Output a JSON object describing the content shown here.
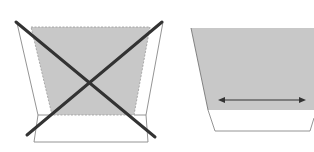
{
  "diagram": {
    "panels": [
      {
        "id": "left",
        "meaning": "incorrect",
        "description": "Tapered gray shape with flared side flaps, crossed out"
      },
      {
        "id": "right",
        "meaning": "correct",
        "description": "Gray shape over white base with horizontal double-headed arrow"
      }
    ],
    "colors": {
      "fill_gray": "#c8c8c8",
      "line_dark": "#333333",
      "line_light": "#888888",
      "background": "#ffffff"
    }
  }
}
